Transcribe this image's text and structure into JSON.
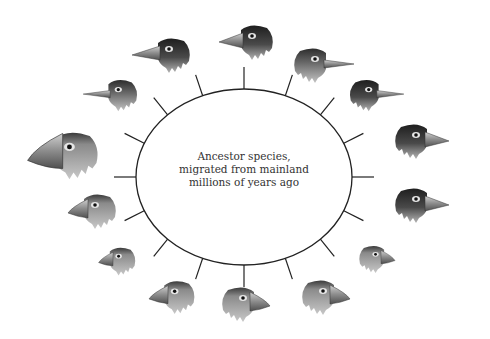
{
  "diagram": {
    "center_label": {
      "lines": [
        "Ancestor species,",
        "migrated from mainland",
        "millions of years ago"
      ]
    },
    "branch_count": 16,
    "species_head_count": 14,
    "species": [
      {
        "id": 1,
        "facing": "left",
        "beak": "medium-pointed",
        "plumage": "dark"
      },
      {
        "id": 2,
        "facing": "left",
        "beak": "long-pointed",
        "plumage": "dark"
      },
      {
        "id": 3,
        "facing": "left",
        "beak": "long-thin",
        "plumage": "mixed"
      },
      {
        "id": 4,
        "facing": "left",
        "beak": "large-thick",
        "plumage": "light"
      },
      {
        "id": 5,
        "facing": "left",
        "beak": "thick",
        "plumage": "light"
      },
      {
        "id": 6,
        "facing": "left",
        "beak": "small-thick",
        "plumage": "light"
      },
      {
        "id": 7,
        "facing": "left",
        "beak": "thick",
        "plumage": "light"
      },
      {
        "id": 8,
        "facing": "right",
        "beak": "thick",
        "plumage": "light"
      },
      {
        "id": 9,
        "facing": "right",
        "beak": "thick",
        "plumage": "light"
      },
      {
        "id": 10,
        "facing": "right",
        "beak": "small-thick",
        "plumage": "light"
      },
      {
        "id": 11,
        "facing": "right",
        "beak": "medium-pointed",
        "plumage": "dark"
      },
      {
        "id": 12,
        "facing": "right",
        "beak": "medium-pointed",
        "plumage": "dark"
      },
      {
        "id": 13,
        "facing": "right",
        "beak": "long-thin",
        "plumage": "dark"
      },
      {
        "id": 14,
        "facing": "right",
        "beak": "long-thin",
        "plumage": "mixed"
      }
    ],
    "colors": {
      "line": "#222222",
      "dark_feather": "#2a2a2a",
      "light_feather": "#a8a8a8",
      "beak": "#9a9a9a",
      "text": "#333333"
    }
  }
}
